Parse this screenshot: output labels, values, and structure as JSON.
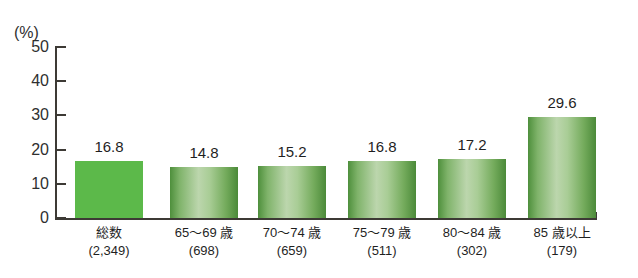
{
  "chart_data": {
    "type": "bar",
    "title": "",
    "xlabel": "",
    "ylabel": "(%)",
    "unit_label": "(%)",
    "ylim": [
      0,
      50
    ],
    "yticks": [
      0,
      10,
      20,
      30,
      40,
      50
    ],
    "ytick_labels": [
      "0",
      "10",
      "20",
      "30",
      "40",
      "50"
    ],
    "grid": false,
    "legend": "none",
    "categories": [
      "総数",
      "65〜69 歳",
      "70〜74 歳",
      "75〜79 歳",
      "80〜84 歳",
      "85 歳以上"
    ],
    "category_counts": [
      "(2,349)",
      "(698)",
      "(659)",
      "(511)",
      "(302)",
      "(179)"
    ],
    "values": [
      16.8,
      14.8,
      15.2,
      16.8,
      17.2,
      29.6
    ],
    "value_labels": [
      "16.8",
      "14.8",
      "15.2",
      "16.8",
      "17.2",
      "29.6"
    ],
    "bar_styles": [
      "solid",
      "gradient",
      "gradient",
      "gradient",
      "gradient",
      "gradient"
    ],
    "colors": {
      "bar_solid": "#5cb94a",
      "bar_gradient_dark": "#4b8a39",
      "bar_gradient_light": "#bcd6ad",
      "axis": "#3d3a35",
      "text": "#1f1f1f"
    }
  }
}
